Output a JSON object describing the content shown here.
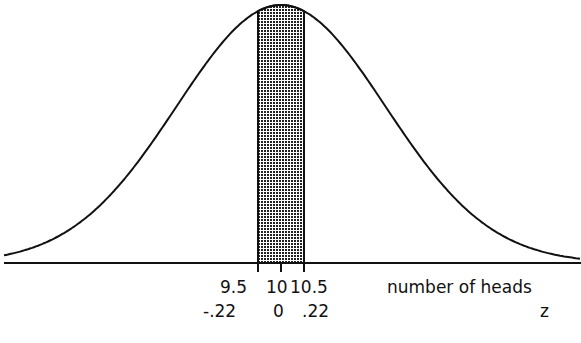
{
  "chart_data": {
    "type": "area",
    "title": "",
    "xlabel": "number of heads",
    "xlabel2": "z",
    "mean": 10,
    "shaded_interval": [
      9.5,
      10.5
    ],
    "shaded_interval_z": [
      -0.22,
      0.22
    ],
    "ticks_x": [
      "9.5",
      "10",
      "10.5"
    ],
    "ticks_z": [
      "-.22",
      "0",
      ".22"
    ],
    "grid": false,
    "legend": "none"
  },
  "labels": {
    "t1": "9.5",
    "t2": "10",
    "t3": "10.5",
    "z1": "-.22",
    "z2": "0",
    "z3": ".22",
    "xaxis": "number of heads",
    "zaxis": "z"
  }
}
